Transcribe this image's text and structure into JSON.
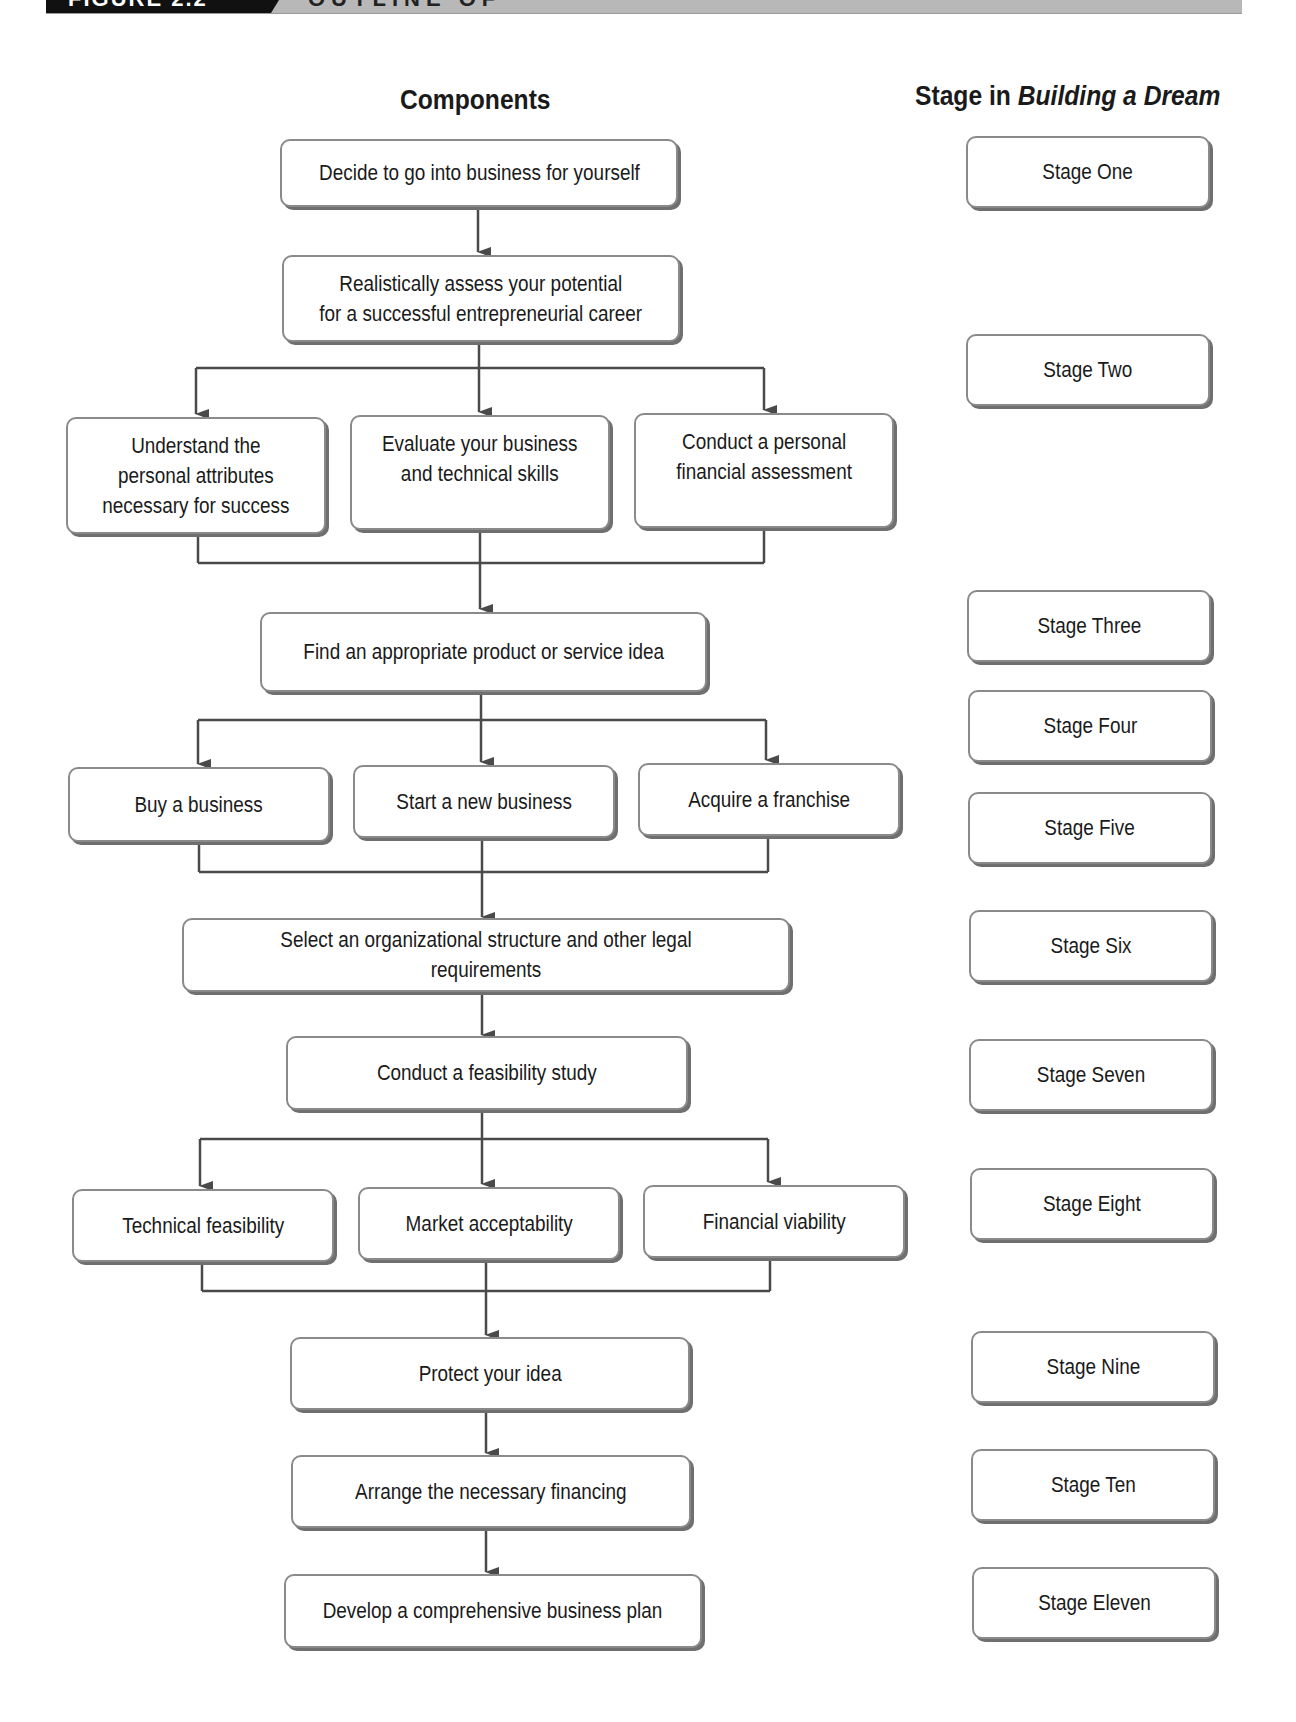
{
  "header": {
    "figure_label": "FIGURE 2.2",
    "title": "OUTLINE OF"
  },
  "columns": {
    "components_heading": "Components",
    "stage_heading_prefix": "Stage in ",
    "stage_heading_italic": "Building a Dream"
  },
  "components": {
    "decide": "Decide to go into business for yourself",
    "assess": "Realistically assess your potential\nfor a successful entrepreneurial career",
    "attributes": "Understand the\npersonal attributes\nnecessary for success",
    "skills": "Evaluate your business\nand technical skills",
    "financial_assessment": "Conduct a personal\nfinancial assessment",
    "idea": "Find an appropriate product or service idea",
    "buy": "Buy a business",
    "start": "Start a new business",
    "franchise": "Acquire a franchise",
    "structure": "Select an organizational structure and other legal requirements",
    "feasibility": "Conduct a feasibility study",
    "technical": "Technical feasibility",
    "market": "Market acceptability",
    "viability": "Financial viability",
    "protect": "Protect your idea",
    "financing": "Arrange the necessary financing",
    "plan": "Develop a comprehensive business plan"
  },
  "stages": [
    "Stage One",
    "Stage Two",
    "Stage Three",
    "Stage Four",
    "Stage Five",
    "Stage Six",
    "Stage Seven",
    "Stage Eight",
    "Stage Nine",
    "Stage Ten",
    "Stage Eleven"
  ],
  "colors": {
    "line": "#4a4a4a",
    "box_border": "#8a8a8a",
    "header_black": "#111111",
    "header_gray": "#b8b8b8"
  }
}
